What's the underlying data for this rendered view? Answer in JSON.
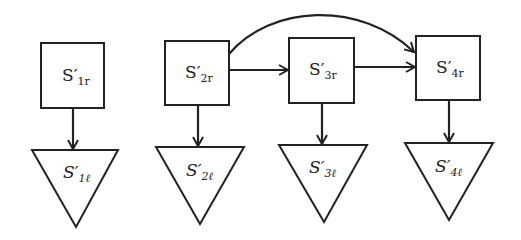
{
  "diagram": {
    "type": "flow",
    "nodes": [
      {
        "id": "S1r",
        "shape": "square",
        "base": "S",
        "prime": "′",
        "sub": "1r",
        "x": 41,
        "y": 43,
        "w": 63,
        "h": 65
      },
      {
        "id": "S2r",
        "shape": "square",
        "base": "S",
        "prime": "′",
        "sub": "2r",
        "x": 165,
        "y": 41,
        "w": 64,
        "h": 64
      },
      {
        "id": "S3r",
        "shape": "square",
        "base": "S",
        "prime": "′",
        "sub": "3r",
        "x": 289,
        "y": 38,
        "w": 65,
        "h": 65
      },
      {
        "id": "S4r",
        "shape": "square",
        "base": "S",
        "prime": "′",
        "sub": "4r",
        "x": 416,
        "y": 36,
        "w": 64,
        "h": 64
      },
      {
        "id": "S1l",
        "shape": "inverted-triangle",
        "base": "S",
        "prime": "′",
        "sub": "1ℓ",
        "x1": 32,
        "x2": 118,
        "top": 150,
        "apex": 227
      },
      {
        "id": "S2l",
        "shape": "inverted-triangle",
        "base": "S",
        "prime": "′",
        "sub": "2ℓ",
        "x1": 156,
        "x2": 244,
        "top": 147,
        "apex": 224
      },
      {
        "id": "S3l",
        "shape": "inverted-triangle",
        "base": "S",
        "prime": "′",
        "sub": "3ℓ",
        "x1": 279,
        "x2": 367,
        "top": 145,
        "apex": 222
      },
      {
        "id": "S4l",
        "shape": "inverted-triangle",
        "base": "S",
        "prime": "′",
        "sub": "4ℓ",
        "x1": 405,
        "x2": 493,
        "top": 143,
        "apex": 220
      }
    ],
    "edges": [
      {
        "from": "S1r",
        "to": "S1l",
        "style": "straight"
      },
      {
        "from": "S2r",
        "to": "S2l",
        "style": "straight"
      },
      {
        "from": "S3r",
        "to": "S3l",
        "style": "straight"
      },
      {
        "from": "S4r",
        "to": "S4l",
        "style": "straight"
      },
      {
        "from": "S2r",
        "to": "S3r",
        "style": "straight"
      },
      {
        "from": "S3r",
        "to": "S4r",
        "style": "straight"
      },
      {
        "from": "S2r",
        "to": "S4r",
        "style": "curved"
      }
    ],
    "colors": {
      "stroke": "#222222",
      "background": "#ffffff"
    }
  },
  "labels": {
    "S1r": {
      "base": "S′",
      "sub": "1r"
    },
    "S2r": {
      "base": "S′",
      "sub": "2r"
    },
    "S3r": {
      "base": "S′",
      "sub": "3r"
    },
    "S4r": {
      "base": "S′",
      "sub": "4r"
    },
    "S1l": {
      "base": "S′",
      "sub": "1ℓ"
    },
    "S2l": {
      "base": "S′",
      "sub": "2ℓ"
    },
    "S3l": {
      "base": "S′",
      "sub": "3ℓ"
    },
    "S4l": {
      "base": "S′",
      "sub": "4ℓ"
    }
  }
}
